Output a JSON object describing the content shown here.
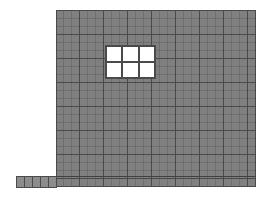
{
  "figure": {
    "name": "masonry-wall-fea-mesh",
    "type": "structural-mesh-diagram",
    "canvas": {
      "width": 267,
      "height": 197,
      "background": "#ffffff"
    }
  },
  "colors": {
    "element_fill": "#808080",
    "element_fill_light": "#8a8a8a",
    "mesh_line": "#4a4a4a",
    "mesh_line_light": "#5e5e5e",
    "opening_fill": "#ffffff",
    "opening_frame": "#4a4a4a",
    "background": "#ffffff",
    "footing_fill": "#8c8c8c"
  },
  "wall_panel": {
    "name": "wall-panel",
    "label": "Wall panel",
    "x": 56,
    "y": 10,
    "width": 199,
    "height": 176,
    "mesh_columns": 25,
    "mesh_rows": 22,
    "cell_width": 7.96,
    "cell_height": 8.0
  },
  "footing": {
    "name": "footing-strip",
    "label": "Footing strip",
    "x": 16,
    "y": 176,
    "width": 40,
    "height": 11,
    "mesh_columns": 5,
    "mesh_rows": 1,
    "cell_width": 8.0,
    "cell_height": 11.0
  },
  "base_course": {
    "name": "base-course-band",
    "label": "Base course",
    "y": 176,
    "height": 11
  },
  "opening": {
    "name": "window-opening",
    "label": "Window opening",
    "x": 106,
    "y": 46,
    "width": 49,
    "height": 32,
    "panes_across": 3,
    "panes_down": 2,
    "mullion_thickness": 2.2,
    "frame_thickness": 1.6,
    "pane_count": 6
  },
  "mesh_emphasis": {
    "name": "heavy-gridlines",
    "label": "Heavy mesh gridlines",
    "vertical_spacing_cells": 3,
    "horizontal_spacing_cells": 3,
    "light_line_width": 0.5,
    "heavy_line_width": 1.0
  },
  "legend_note": {
    "name": "figure-note",
    "text": ""
  }
}
